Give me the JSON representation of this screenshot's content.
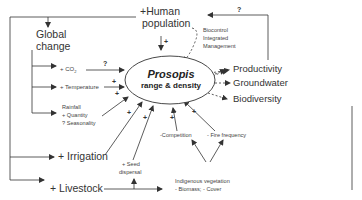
{
  "diagram": {
    "center": {
      "title": "Prosopis",
      "subtitle": "range & density"
    },
    "drivers": {
      "human_population": [
        "+Human",
        "population"
      ],
      "global_change": [
        "Global",
        "change"
      ],
      "co2": "+ CO",
      "co2_sub": "2",
      "temperature": "+ Temperature",
      "rainfall": [
        "Rainfall",
        "+ Quantity",
        "? Seasonality"
      ],
      "irrigation": "+ Irrigation",
      "livestock": "+ Livestock",
      "seed_dispersal": [
        "+ Seed",
        "dispersal"
      ],
      "competition": "-Competition",
      "fire_frequency": "- Fire frequency",
      "indigenous_vegetation": [
        "Indigenous vegetation",
        "- Biomass; - Cover"
      ]
    },
    "management": [
      "Biocontrol",
      "Integrated",
      "Management"
    ],
    "outcomes": [
      "Productivity",
      "Groundwater",
      "Biodiversity"
    ],
    "signs": {
      "co2_q": "?",
      "feedback_q": "?",
      "human_plus": "+",
      "temp_plus": "+",
      "rain_plus": "+",
      "irrigation_plus": "+",
      "seed_plus": "+",
      "competition_plus": "+",
      "fire_plus": "+",
      "outcome_minus": [
        "–",
        "–",
        "–"
      ]
    },
    "colors": {
      "line": "#333333",
      "text": "#333333",
      "background": "#ffffff"
    }
  }
}
